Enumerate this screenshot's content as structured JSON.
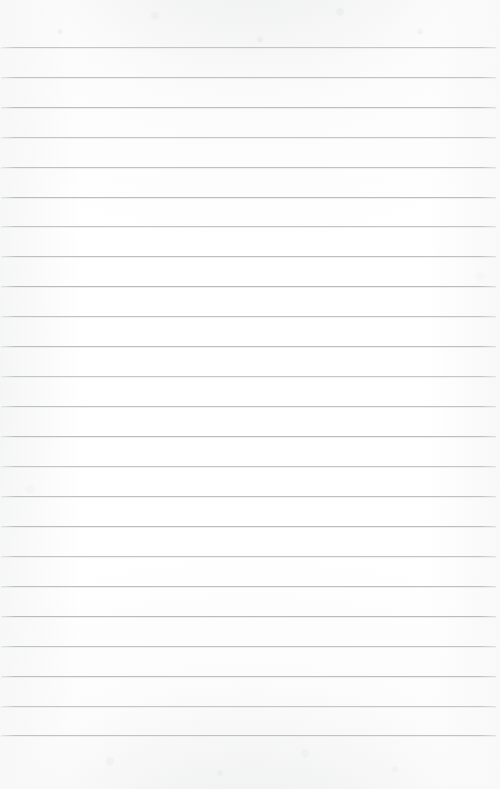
{
  "document": {
    "kind": "scanned-lined-notebook-page",
    "title": "Blank ruled notebook page",
    "page_width": 500,
    "page_height": 789,
    "content_text": "",
    "has_handwriting": false,
    "has_printed_text": false
  },
  "paper": {
    "background_color": "#fefefe",
    "texture_color": "#cdcfd2",
    "top_margin_px": 47,
    "bottom_margin_px": 54,
    "left_margin_px": 1,
    "right_margin_px": 4
  },
  "ruling": {
    "line_color": "#b9bbbe",
    "line_highlight_color": "#eceef0",
    "line_thickness_px": 1,
    "line_count": 24,
    "line_spacing_px": 29.9,
    "first_line_y_px": 47,
    "last_line_y_px": 735,
    "line_start_x_px": 1,
    "line_end_x_px": 496,
    "has_margin_rule": false,
    "orientation": "horizontal",
    "line_y_positions": [
      47,
      77,
      107,
      137,
      167,
      197,
      226,
      256,
      286,
      316,
      346,
      376,
      406,
      436,
      466,
      496,
      526,
      556,
      586,
      616,
      646,
      676,
      706,
      735
    ]
  }
}
